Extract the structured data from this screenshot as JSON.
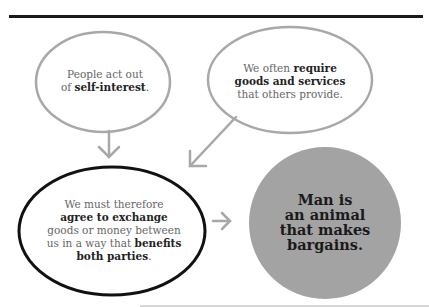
{
  "diagram": {
    "colors": {
      "rule": "#1a1a1a",
      "bubble_gray": "#a8a8a8",
      "bubble_black": "#111111",
      "circle_fill": "#a3a3a3",
      "text": "#666666",
      "text_bold": "#222222"
    },
    "bubble1": {
      "line1": "People act out",
      "line2_pre": "of ",
      "line2_bold": "self-interest",
      "line2_post": "."
    },
    "bubble2": {
      "line1_pre": "We often ",
      "line1_bold": "require",
      "line2_bold": "goods and services",
      "line3": "that others provide."
    },
    "bubble3": {
      "line1": "We must therefore",
      "line2_bold": "agree to exchange",
      "line3": "goods or money between",
      "line4_pre": "us in a way that ",
      "line4_bold": "benefits",
      "line5_bold": "both parties",
      "line5_post": "."
    },
    "conclusion": {
      "line1": "Man is",
      "line2": "an animal",
      "line3": "that makes",
      "line4": "bargains."
    },
    "arrows": [
      "arrow-down-icon",
      "arrow-down-left-icon",
      "arrow-right-icon"
    ]
  }
}
